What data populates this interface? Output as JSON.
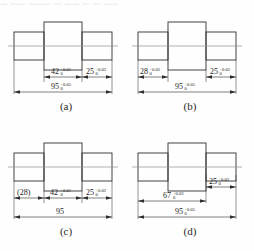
{
  "page": {
    "top_partial_text": "― ―― ――― ― ―― ― ― ――",
    "figure_type": "engineering-dimensioning-comparison",
    "colors": {
      "outline": "#303030",
      "centerline": "#8f8f8f",
      "dimension": "#2e2e2e",
      "background": "#fefefe",
      "text": "#1d1d1d"
    }
  },
  "panels": [
    {
      "id": "a",
      "caption": "(a)",
      "dimensions": [
        {
          "name": "center-width",
          "value": "42",
          "upper": "+0.01",
          "lower": "0",
          "row": "upper",
          "basic": false
        },
        {
          "name": "right-step",
          "value": "25",
          "upper": "+0.02",
          "lower": "0",
          "row": "upper",
          "basic": false
        },
        {
          "name": "overall-length",
          "value": "95",
          "upper": "+0.05",
          "lower": "0",
          "row": "lower",
          "basic": false
        }
      ]
    },
    {
      "id": "b",
      "caption": "(b)",
      "dimensions": [
        {
          "name": "left-step",
          "value": "28",
          "upper": "+0.02",
          "lower": "0",
          "row": "upper",
          "basic": false
        },
        {
          "name": "right-step",
          "value": "25",
          "upper": "+0.02",
          "lower": "0",
          "row": "upper",
          "basic": false
        },
        {
          "name": "overall-length",
          "value": "95",
          "upper": "+0.05",
          "lower": "0",
          "row": "lower",
          "basic": false
        }
      ]
    },
    {
      "id": "c",
      "caption": "(c)",
      "dimensions": [
        {
          "name": "left-step-reference",
          "value": "(28)",
          "upper": "",
          "lower": "",
          "row": "upper",
          "basic": true
        },
        {
          "name": "center-width",
          "value": "42",
          "upper": "+0.01",
          "lower": "0",
          "row": "upper",
          "basic": false
        },
        {
          "name": "right-step",
          "value": "25",
          "upper": "+0.02",
          "lower": "0",
          "row": "upper",
          "basic": false
        },
        {
          "name": "overall-length",
          "value": "95",
          "upper": "",
          "lower": "",
          "row": "lower",
          "basic": true
        }
      ]
    },
    {
      "id": "d",
      "caption": "(d)",
      "dimensions": [
        {
          "name": "right-step",
          "value": "25",
          "upper": "+0.02",
          "lower": "0",
          "row": "top",
          "basic": false
        },
        {
          "name": "left-plus-center",
          "value": "67",
          "upper": "+0.03",
          "lower": "0",
          "row": "upper",
          "basic": false
        },
        {
          "name": "overall-length",
          "value": "95",
          "upper": "+0.05",
          "lower": "0",
          "row": "lower",
          "basic": false
        }
      ]
    }
  ]
}
